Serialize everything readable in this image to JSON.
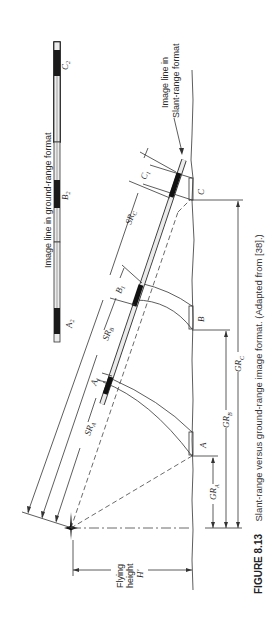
{
  "figure": {
    "caption_number": "FIGURE 8.13",
    "caption_text": "Slant-range versus ground-range image format. (Adapted from [38].)"
  },
  "labels": {
    "ground_range_strip": "Image line in ground-range format",
    "slant_range_strip_line1": "Image line in",
    "slant_range_strip_line2": "Slant-range format",
    "A2": "A",
    "A2_sub": "2",
    "B2": "B",
    "B2_sub": "2",
    "C2": "C",
    "C2_sub": "2",
    "A1": "A",
    "A1_sub": "1",
    "B1": "B",
    "B1_sub": "1",
    "C1": "C",
    "C1_sub": "1",
    "A": "A",
    "B": "B",
    "C": "C",
    "SRA": "SR",
    "SRA_sub": "A",
    "SRB": "SR",
    "SRB_sub": "B",
    "SRC": "SR",
    "SRC_sub": "C",
    "GRA": "GR",
    "GRA_sub": "A",
    "GRB": "GR",
    "GRB_sub": "B",
    "GRC": "GR",
    "GRC_sub": "C",
    "flying_height_line1": "Flying",
    "flying_height_line2": "height",
    "flying_height_symbol": "H'"
  },
  "colors": {
    "ink": "#2a2a2a",
    "strip_fill": "#e8e8e8",
    "strip_dark": "#1a1a1a",
    "background": "#ffffff"
  }
}
